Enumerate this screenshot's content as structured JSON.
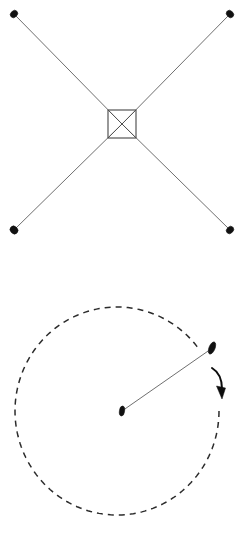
{
  "canvas": {
    "width": 245,
    "height": 534,
    "background_color": "#ffffff"
  },
  "style": {
    "line_color": "#4a4a4a",
    "dash_color": "#2b2b2b",
    "box_color": "#555555",
    "marker_color": "#111111",
    "arrow_color": "#0d0d0d",
    "line_width": 0.8,
    "box_line_width": 1.2,
    "dash_width": 1.5,
    "dash_pattern": "6 5"
  },
  "figures": [
    {
      "id": "crossed-pendulums",
      "name": "crossed-lines-with-central-box",
      "panel_origin_y": 0,
      "box": {
        "name": "central-square",
        "x": 108,
        "y": 110,
        "width": 28,
        "height": 28,
        "diagonals": true
      },
      "crossing_point": {
        "x": 122,
        "y": 124
      },
      "lines": [
        {
          "name": "line-upper-left",
          "x1": 122,
          "y1": 124,
          "x2": 15,
          "y2": 15
        },
        {
          "name": "line-upper-right",
          "x1": 122,
          "y1": 124,
          "x2": 229,
          "y2": 15
        },
        {
          "name": "line-lower-left",
          "x1": 122,
          "y1": 124,
          "x2": 15,
          "y2": 229
        },
        {
          "name": "line-lower-right",
          "x1": 122,
          "y1": 124,
          "x2": 229,
          "y2": 229
        }
      ],
      "markers": [
        {
          "name": "bob-upper-left",
          "cx": 14,
          "cy": 14,
          "rx": 4.0,
          "ry": 3.2,
          "rotation": -45
        },
        {
          "name": "bob-upper-right",
          "cx": 230,
          "cy": 14,
          "rx": 4.0,
          "ry": 3.2,
          "rotation": 45
        },
        {
          "name": "bob-lower-left",
          "cx": 14,
          "cy": 230,
          "rx": 4.2,
          "ry": 3.6,
          "rotation": 45
        },
        {
          "name": "bob-lower-right",
          "cx": 230,
          "cy": 230,
          "rx": 4.0,
          "ry": 3.2,
          "rotation": -45
        }
      ]
    },
    {
      "id": "rotating-arm",
      "name": "dashed-circle-with-radius-arm",
      "panel_origin_y": 267,
      "circle": {
        "name": "dashed-orbit",
        "cx": 117,
        "cy": 411,
        "rx": 102,
        "ry": 104,
        "start_angle_deg": -37,
        "sweep_deg": 323,
        "dashed": true
      },
      "pivot": {
        "name": "pivot-bob",
        "cx": 122,
        "cy": 411,
        "rx": 2.6,
        "ry": 5.0,
        "rotation": 8
      },
      "orbiting": {
        "name": "orbiting-bob",
        "cx": 212,
        "cy": 348,
        "rx": 3.0,
        "ry": 6.4,
        "rotation": 22
      },
      "arm": {
        "name": "radius-arm",
        "x1": 122,
        "y1": 411,
        "x2": 211,
        "y2": 349
      },
      "direction_arrow": {
        "name": "rotation-direction-arrow",
        "path": "M 212 368 Q 222 374 222 389",
        "tip": {
          "x": 222,
          "y": 399
        },
        "head_width": 9,
        "head_length": 13,
        "direction": "clockwise"
      }
    }
  ]
}
